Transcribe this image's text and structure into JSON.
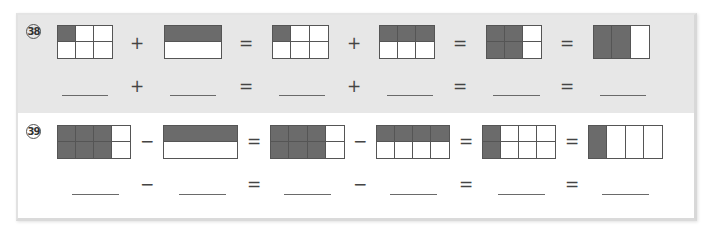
{
  "problems": [
    {
      "number": "38",
      "operation": "+",
      "shaded_bg": "#e7e7e7",
      "diagrams": [
        {
          "rows": 2,
          "cols": 3,
          "shaded": [
            [
              0,
              0
            ]
          ],
          "left": 57,
          "width": 56,
          "fraction": "1/6"
        },
        {
          "rows": 2,
          "cols": 1,
          "shaded": [
            [
              0,
              0
            ]
          ],
          "left": 164,
          "width": 58,
          "fraction": "1/2"
        },
        {
          "rows": 2,
          "cols": 3,
          "shaded": [
            [
              0,
              0
            ]
          ],
          "left": 272,
          "width": 57,
          "fraction": "1/6"
        },
        {
          "rows": 2,
          "cols": 3,
          "shaded": [
            [
              0,
              0
            ],
            [
              0,
              1
            ],
            [
              0,
              2
            ]
          ],
          "left": 379,
          "width": 56,
          "fraction": "3/6"
        },
        {
          "rows": 2,
          "cols": 3,
          "shaded": [
            [
              0,
              0
            ],
            [
              0,
              1
            ],
            [
              1,
              0
            ],
            [
              1,
              1
            ]
          ],
          "left": 486,
          "width": 56,
          "fraction": "4/6"
        },
        {
          "rows": 1,
          "cols": 3,
          "shaded": [
            [
              0,
              0
            ],
            [
              0,
              1
            ]
          ],
          "left": 593,
          "width": 57,
          "fraction": "2/3"
        }
      ],
      "operators": [
        "+",
        "=",
        "+",
        "=",
        "="
      ],
      "answer_operators": [
        "+",
        "=",
        "+",
        "=",
        "="
      ],
      "answer_blanks": [
        "",
        "",
        "",
        "",
        "",
        ""
      ]
    },
    {
      "number": "39",
      "operation": "−",
      "diagrams": [
        {
          "rows": 2,
          "cols": 4,
          "shaded": [
            [
              0,
              0
            ],
            [
              0,
              1
            ],
            [
              0,
              2
            ],
            [
              1,
              0
            ],
            [
              1,
              1
            ],
            [
              1,
              2
            ]
          ],
          "left": 57,
          "width": 74,
          "fraction": "6/8"
        },
        {
          "rows": 2,
          "cols": 1,
          "shaded": [
            [
              0,
              0
            ]
          ],
          "left": 163,
          "width": 75,
          "fraction": "1/2"
        },
        {
          "rows": 2,
          "cols": 4,
          "shaded": [
            [
              0,
              0
            ],
            [
              0,
              1
            ],
            [
              0,
              2
            ],
            [
              1,
              0
            ],
            [
              1,
              1
            ],
            [
              1,
              2
            ]
          ],
          "left": 270,
          "width": 75,
          "fraction": "6/8"
        },
        {
          "rows": 2,
          "cols": 4,
          "shaded": [
            [
              0,
              0
            ],
            [
              0,
              1
            ],
            [
              0,
              2
            ],
            [
              0,
              3
            ]
          ],
          "left": 376,
          "width": 74,
          "fraction": "4/8"
        },
        {
          "rows": 2,
          "cols": 4,
          "shaded": [
            [
              0,
              0
            ],
            [
              1,
              0
            ]
          ],
          "left": 482,
          "width": 74,
          "fraction": "2/8"
        },
        {
          "rows": 1,
          "cols": 4,
          "shaded": [
            [
              0,
              0
            ]
          ],
          "left": 588,
          "width": 75,
          "fraction": "1/4"
        }
      ],
      "operators": [
        "−",
        "=",
        "−",
        "=",
        "="
      ],
      "answer_operators": [
        "−",
        "=",
        "−",
        "=",
        "="
      ],
      "answer_blanks": [
        "",
        "",
        "",
        "",
        "",
        ""
      ]
    }
  ],
  "colors": {
    "shaded_cell": "#6b6b6b",
    "grid_line": "#555555",
    "problem38_background": "#e7e7e7",
    "problem39_background": "#ffffff"
  }
}
